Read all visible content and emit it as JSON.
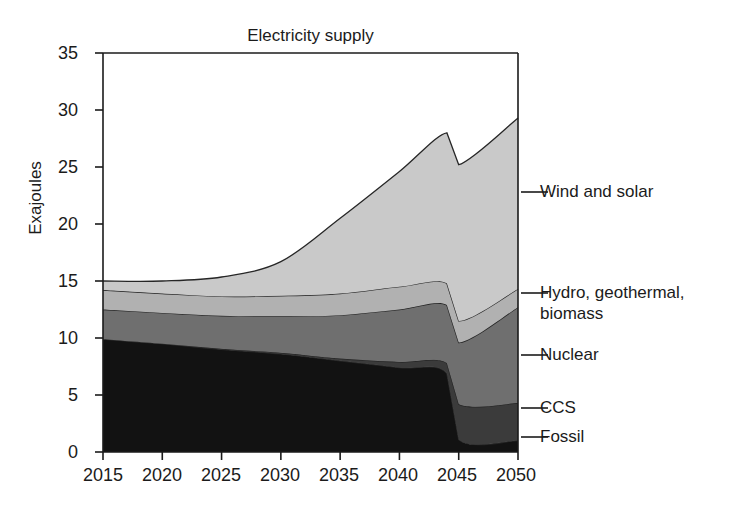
{
  "chart_data": {
    "type": "area",
    "stacked": true,
    "title": "Electricity supply",
    "xlabel": "",
    "ylabel": "Exajoules",
    "x": [
      2015,
      2020,
      2025,
      2030,
      2035,
      2040,
      2044,
      2045,
      2050
    ],
    "xlim": [
      2015,
      2050
    ],
    "ylim": [
      0,
      35
    ],
    "xticks": [
      "2015",
      "2020",
      "2025",
      "2030",
      "2035",
      "2040",
      "2045",
      "2050"
    ],
    "yticks": [
      "0",
      "5",
      "10",
      "15",
      "20",
      "25",
      "30",
      "35"
    ],
    "grid": false,
    "legend_position": "right-outside",
    "series": [
      {
        "name": "Fossil",
        "color": "#121212",
        "values": [
          9.9,
          9.5,
          9.0,
          8.6,
          8.0,
          7.4,
          6.9,
          1.1,
          1.0
        ]
      },
      {
        "name": "CCS",
        "color": "#3b3b3b",
        "values": [
          0.0,
          0.0,
          0.05,
          0.1,
          0.2,
          0.5,
          0.9,
          3.1,
          3.3
        ]
      },
      {
        "name": "Nuclear",
        "color": "#6f6f6f",
        "values": [
          2.6,
          2.7,
          2.9,
          3.2,
          3.8,
          4.6,
          5.1,
          5.4,
          8.4
        ]
      },
      {
        "name": "Hydro, geothermal, biomass",
        "color": "#b1b1b1",
        "values": [
          1.7,
          1.7,
          1.7,
          1.8,
          1.9,
          2.0,
          1.9,
          1.9,
          1.6
        ]
      },
      {
        "name": "Wind and solar",
        "color": "#c9c9c9",
        "values": [
          0.8,
          1.1,
          1.7,
          3.0,
          6.6,
          10.1,
          13.2,
          13.7,
          15.0
        ]
      }
    ],
    "totals": [
      15.0,
      15.0,
      15.35,
      16.7,
      20.5,
      24.6,
      28.0,
      25.2,
      29.3
    ],
    "legend_entries": [
      "Wind and solar",
      "Hydro, geothermal,\nbiomass",
      "Nuclear",
      "CCS",
      "Fossil"
    ]
  },
  "axes": {
    "y_title": "Exajoules"
  }
}
